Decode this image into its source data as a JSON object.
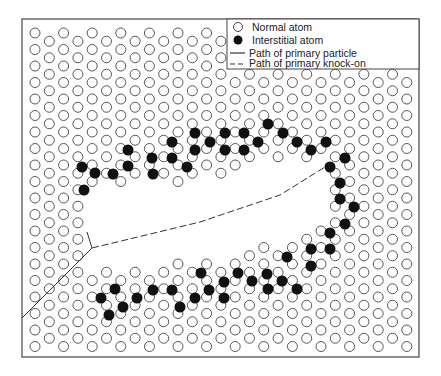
{
  "figure": {
    "frame": {
      "x": 22,
      "y": 19,
      "width": 397,
      "height": 338
    },
    "colors": {
      "line": "#333333",
      "atom_stroke": "#444444",
      "interstitial_fill": "#111111",
      "background": "#ffffff"
    },
    "lattice": {
      "col_start_x": 35,
      "col_spacing": 14.3,
      "num_cols": 27,
      "row_start_y": 33,
      "row_spacing": 16.5,
      "num_rows_even_col": 20,
      "num_rows_odd_col": 19,
      "odd_col_offset_y": 8.25,
      "atom_radius": 5
    },
    "void_region": [
      [
        92,
        196
      ],
      [
        125,
        180
      ],
      [
        180,
        183
      ],
      [
        260,
        165
      ],
      [
        325,
        158
      ],
      [
        332,
        170
      ],
      [
        318,
        228
      ],
      [
        286,
        240
      ],
      [
        240,
        254
      ],
      [
        180,
        262
      ],
      [
        140,
        270
      ],
      [
        92,
        270
      ],
      [
        80,
        235
      ]
    ],
    "legend_cover": {
      "x": 227,
      "y": 19,
      "width": 192,
      "height": 50
    },
    "interstitials": [
      [
        82,
        167
      ],
      [
        95,
        173
      ],
      [
        84,
        190
      ],
      [
        113,
        174
      ],
      [
        128,
        150
      ],
      [
        128,
        166
      ],
      [
        152,
        158
      ],
      [
        153,
        174
      ],
      [
        172,
        142
      ],
      [
        172,
        158
      ],
      [
        187,
        167
      ],
      [
        195,
        133
      ],
      [
        195,
        150
      ],
      [
        210,
        142
      ],
      [
        225,
        133
      ],
      [
        225,
        150
      ],
      [
        244,
        133
      ],
      [
        244,
        150
      ],
      [
        258,
        142
      ],
      [
        268,
        124
      ],
      [
        283,
        133
      ],
      [
        297,
        142
      ],
      [
        311,
        150
      ],
      [
        326,
        142
      ],
      [
        345,
        158
      ],
      [
        330,
        167
      ],
      [
        340,
        183
      ],
      [
        340,
        199
      ],
      [
        354,
        207
      ],
      [
        345,
        224
      ],
      [
        330,
        233
      ],
      [
        330,
        249
      ],
      [
        311,
        249
      ],
      [
        311,
        266
      ],
      [
        287,
        257
      ],
      [
        267,
        274
      ],
      [
        282,
        281
      ],
      [
        297,
        289
      ],
      [
        268,
        289
      ],
      [
        252,
        281
      ],
      [
        238,
        273
      ],
      [
        224,
        282
      ],
      [
        209,
        290
      ],
      [
        224,
        298
      ],
      [
        201,
        273
      ],
      [
        195,
        298
      ],
      [
        180,
        307
      ],
      [
        172,
        290
      ],
      [
        153,
        290
      ],
      [
        137,
        298
      ],
      [
        123,
        307
      ],
      [
        115,
        289
      ],
      [
        101,
        298
      ],
      [
        109,
        315
      ]
    ],
    "paths": {
      "primary_particle": [
        [
          22,
          318
        ],
        [
          92,
          248
        ]
      ],
      "primary_particle_branch": [
        [
          92,
          248
        ],
        [
          87,
          232
        ]
      ],
      "primary_knock_on": [
        [
          92,
          248
        ],
        [
          200,
          222
        ],
        [
          280,
          195
        ],
        [
          325,
          167
        ]
      ]
    }
  },
  "legend": {
    "items": [
      {
        "symbol": "open-circle",
        "label": "Normal atom"
      },
      {
        "symbol": "filled-circle",
        "label": "Interstitial atom"
      },
      {
        "symbol": "solid-line",
        "label": "Path of primary particle"
      },
      {
        "symbol": "dashed-line",
        "label": "Path of primary knock-on"
      }
    ]
  }
}
